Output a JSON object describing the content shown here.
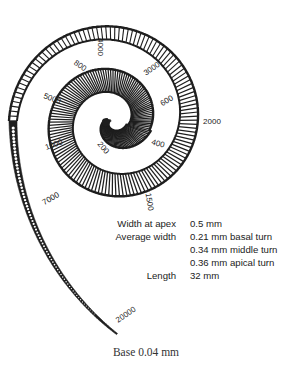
{
  "figure": {
    "frequency_labels_hz": [
      {
        "text": "4000",
        "x": 100,
        "y": 47,
        "rot": 90
      },
      {
        "text": "800",
        "x": 80,
        "y": 66,
        "rot": 35
      },
      {
        "text": "3000",
        "x": 152,
        "y": 69,
        "rot": -35
      },
      {
        "text": "5000",
        "x": 52,
        "y": 99,
        "rot": 20
      },
      {
        "text": "600",
        "x": 167,
        "y": 101,
        "rot": -30
      },
      {
        "text": "2000",
        "x": 212,
        "y": 122,
        "rot": 0
      },
      {
        "text": "1000",
        "x": 54,
        "y": 145,
        "rot": -20
      },
      {
        "text": "400",
        "x": 158,
        "y": 144,
        "rot": 15
      },
      {
        "text": "200",
        "x": 103,
        "y": 148,
        "rot": 50
      },
      {
        "text": "7000",
        "x": 51,
        "y": 199,
        "rot": -30
      },
      {
        "text": "1500",
        "x": 149,
        "y": 202,
        "rot": 80
      },
      {
        "text": "20000",
        "x": 126,
        "y": 315,
        "rot": -35
      }
    ]
  },
  "specs": [
    {
      "label": "Width at apex",
      "value": "0.5 mm"
    },
    {
      "label": "Average width",
      "value": "0.21 mm basal turn"
    },
    {
      "label": "",
      "value": "0.34 mm middle turn"
    },
    {
      "label": "",
      "value": "0.36 mm apical turn"
    },
    {
      "label": "Length",
      "value": "32 mm"
    }
  ],
  "caption": "Base 0.04 mm",
  "colors": {
    "ink": "#1e1e1e",
    "background": "#ffffff"
  }
}
